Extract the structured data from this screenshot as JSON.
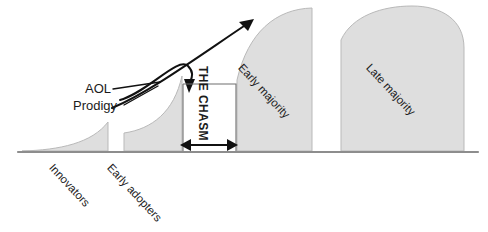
{
  "diagram": {
    "type": "area-curve-diagram",
    "palette": {
      "segment_fill": "#dedede",
      "segment_stroke": "#b9b9b9",
      "baseline": "#8d8d8d",
      "ink": "#111111",
      "background": "#ffffff"
    },
    "segments": [
      {
        "key": "innovators",
        "label": "Innovators",
        "label_rotation_deg": 47,
        "label_placement": "below-axis"
      },
      {
        "key": "early_adopters",
        "label": "Early adopters",
        "label_rotation_deg": 47,
        "label_placement": "below-axis"
      },
      {
        "key": "early_majority",
        "label": "Early majority",
        "label_rotation_deg": 47,
        "label_placement": "inside-shape"
      },
      {
        "key": "late_majority",
        "label": "Late majority",
        "label_rotation_deg": 47,
        "label_placement": "inside-shape"
      }
    ],
    "gap": {
      "label": "THE CHASM",
      "label_rotation_deg": 90,
      "arrow": "double-headed-horizontal"
    },
    "callouts": [
      {
        "key": "aol",
        "label": "AOL"
      },
      {
        "key": "prodigy",
        "label": "Prodigy"
      }
    ],
    "annotations": {
      "growth_arrow": "diagonal-up-right-arrow",
      "drop_arrow": "curved-hook-down-arrow"
    }
  }
}
